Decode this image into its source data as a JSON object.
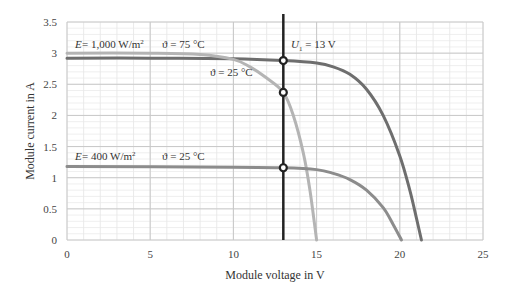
{
  "chart_data": {
    "type": "line",
    "title": "",
    "xlabel": "Module voltage in V",
    "ylabel": "Module current in A",
    "xlim": [
      0,
      25
    ],
    "ylim": [
      0,
      3.5
    ],
    "x_ticks": [
      "0",
      "5",
      "10",
      "15",
      "20",
      "25"
    ],
    "y_ticks": [
      "0",
      "0.5",
      "1",
      "1.5",
      "2",
      "2.5",
      "3",
      "3.5"
    ],
    "grid": true,
    "series": [
      {
        "name": "E = 1,000 W/m², ϑ = 25 °C",
        "color": "#6e6e6e",
        "points": [
          [
            0,
            2.92
          ],
          [
            5,
            2.92
          ],
          [
            10,
            2.91
          ],
          [
            13,
            2.88
          ],
          [
            15,
            2.84
          ],
          [
            16,
            2.78
          ],
          [
            17,
            2.66
          ],
          [
            18,
            2.42
          ],
          [
            19,
            2.0
          ],
          [
            20,
            1.35
          ],
          [
            20.6,
            0.8
          ],
          [
            21,
            0.35
          ],
          [
            21.3,
            0
          ]
        ]
      },
      {
        "name": "E = 1,000 W/m², ϑ = 75 °C",
        "color": "#b4b4b4",
        "points": [
          [
            0,
            3.0
          ],
          [
            5,
            3.0
          ],
          [
            8,
            2.98
          ],
          [
            10,
            2.9
          ],
          [
            11,
            2.78
          ],
          [
            12,
            2.6
          ],
          [
            13,
            2.37
          ],
          [
            13.6,
            2.0
          ],
          [
            14.2,
            1.4
          ],
          [
            14.6,
            0.8
          ],
          [
            15,
            0
          ]
        ]
      },
      {
        "name": "E = 400 W/m², ϑ = 25 °C",
        "color": "#8c8c8c",
        "points": [
          [
            0,
            1.18
          ],
          [
            10,
            1.17
          ],
          [
            13,
            1.16
          ],
          [
            15,
            1.13
          ],
          [
            16,
            1.07
          ],
          [
            17,
            0.97
          ],
          [
            18,
            0.8
          ],
          [
            19,
            0.52
          ],
          [
            19.6,
            0.25
          ],
          [
            20.1,
            0
          ]
        ]
      }
    ],
    "vertical_line": {
      "label": "U1 = 13 V",
      "x": 13,
      "color": "#222222"
    },
    "markers": [
      {
        "x": 13,
        "y": 2.88
      },
      {
        "x": 13,
        "y": 2.37
      },
      {
        "x": 13,
        "y": 1.16
      }
    ],
    "annotations": [
      {
        "text": "E = 1,000 W/m²",
        "x": 0.5,
        "y": 3.07
      },
      {
        "text": "ϑ = 75 °C",
        "x": 6.4,
        "y": 3.07
      },
      {
        "text": "ϑ = 25 °C",
        "x": 8.6,
        "y": 2.63
      },
      {
        "text": "U1 = 13 V",
        "x": 13.4,
        "y": 3.07
      },
      {
        "text": "E = 400 W/m²",
        "x": 0.5,
        "y": 1.25
      },
      {
        "text": "ϑ = 25 °C",
        "x": 6.4,
        "y": 1.25
      }
    ]
  },
  "labels": {
    "xlabel": "Module voltage in V",
    "ylabel": "Module current in A",
    "e1000": "E = 1,000 W/m",
    "e400": "E = 400 W/m",
    "theta75": "ϑ = 75 °C",
    "theta25_top": "ϑ = 25 °C",
    "theta25_bottom": "ϑ = 25 °C",
    "u1_prefix": "U",
    "u1_sub": "1",
    "u1_suffix": " = 13 V"
  }
}
